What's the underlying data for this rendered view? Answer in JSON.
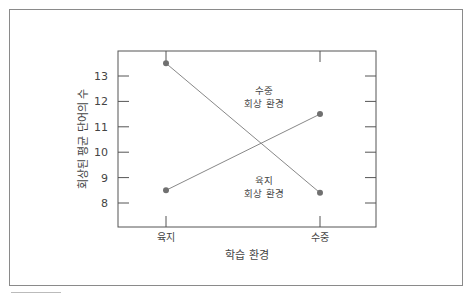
{
  "chart_data": {
    "type": "line",
    "title": "",
    "xlabel": "학습 환경",
    "ylabel": "회상된 평균 단어의 수",
    "categories": [
      "육지",
      "수중"
    ],
    "yticks": [
      8,
      9,
      10,
      11,
      12,
      13
    ],
    "ylim": [
      7.1,
      13.9
    ],
    "grid": false,
    "series": [
      {
        "name": "수중 회상 환경",
        "values": [
          13.5,
          8.4
        ],
        "color": "#777777"
      },
      {
        "name": "육지 회상 환경",
        "values": [
          8.5,
          11.5
        ],
        "color": "#777777"
      }
    ],
    "annotations": [
      {
        "line1": "수중",
        "line2": "회상 환경"
      },
      {
        "line1": "육지",
        "line2": "회상 환경"
      }
    ]
  }
}
